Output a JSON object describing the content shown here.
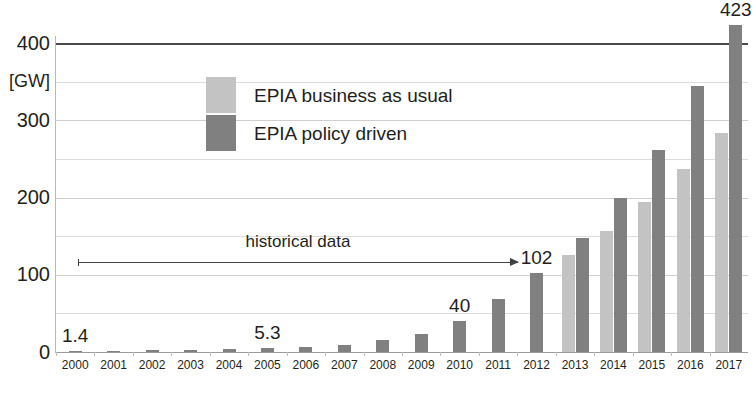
{
  "chart_data": {
    "type": "bar",
    "title": "",
    "xlabel": "",
    "ylabel": "[GW]",
    "ylim": [
      0,
      400
    ],
    "grid": true,
    "legend_position": "upper-left-inside",
    "categories": [
      "2000",
      "2001",
      "2002",
      "2003",
      "2004",
      "2005",
      "2006",
      "2007",
      "2008",
      "2009",
      "2010",
      "2011",
      "2012",
      "2013",
      "2014",
      "2015",
      "2016",
      "2017"
    ],
    "y_ticks": [
      "0",
      "100",
      "200",
      "300",
      "400"
    ],
    "y_tick_values": [
      0,
      100,
      200,
      300,
      400
    ],
    "series": [
      {
        "name": "EPIA business as usual",
        "color": "#c3c3c3",
        "values": [
          null,
          null,
          null,
          null,
          null,
          null,
          null,
          null,
          null,
          null,
          null,
          null,
          null,
          126,
          157,
          194,
          237,
          284
        ]
      },
      {
        "name": "EPIA policy driven",
        "color": "#808080",
        "values": [
          1.4,
          1.8,
          2.4,
          3.0,
          3.9,
          5.3,
          7.0,
          9.4,
          15.5,
          23.0,
          40.0,
          69.0,
          102.0,
          148,
          199,
          261,
          345,
          423
        ]
      }
    ],
    "data_labels": [
      {
        "category": "2000",
        "text": "1.4"
      },
      {
        "category": "2005",
        "text": "5.3"
      },
      {
        "category": "2010",
        "text": "40"
      },
      {
        "category": "2012",
        "text": "102"
      },
      {
        "category": "2017",
        "text": "423"
      }
    ],
    "annotations": [
      {
        "text": "historical data",
        "type": "arrow-right",
        "from_category": "2000",
        "to_category": "2012"
      }
    ]
  },
  "legend": {
    "items": [
      {
        "label": "EPIA business as usual",
        "color": "#c3c3c3"
      },
      {
        "label": "EPIA policy driven",
        "color": "#808080"
      }
    ]
  },
  "axis": {
    "unit": "[GW]"
  },
  "colors": {
    "light_bar": "#c3c3c3",
    "dark_bar": "#808080",
    "grid": "#dcdcdc",
    "top_rule": "#4a4a4a",
    "text": "#231f20"
  }
}
